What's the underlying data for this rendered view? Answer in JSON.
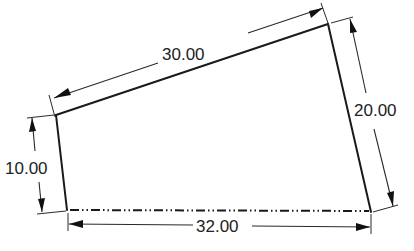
{
  "diagram": {
    "type": "dimensioned-quadrilateral",
    "shape": {
      "vertices": {
        "top_left": [
          56,
          115
        ],
        "top_right": [
          328,
          24
        ],
        "bottom_right": [
          371,
          212
        ],
        "bottom_left": [
          67,
          210
        ]
      },
      "bottom_edge_style": "dash-dot-dot"
    },
    "dimensions": {
      "top": {
        "label": "30.00"
      },
      "right": {
        "label": "20.00"
      },
      "left": {
        "label": "10.00"
      },
      "bottom": {
        "label": "32.00"
      }
    },
    "colors": {
      "line": "#1a1a1a",
      "text": "#222222",
      "background": "#ffffff"
    }
  }
}
